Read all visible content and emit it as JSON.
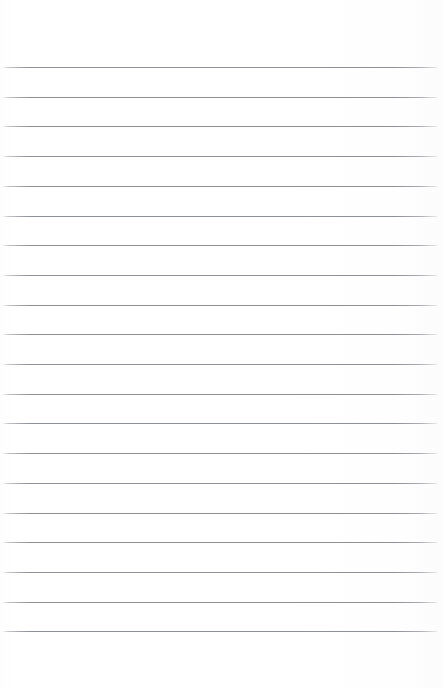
{
  "document": {
    "kind": "lined-paper",
    "title": "",
    "body_text": "",
    "page_number": "",
    "background_color": "#ffffff",
    "rule_color": "#8d9096",
    "sheet": {
      "width_px": 442,
      "height_px": 688
    },
    "ruling": {
      "line_count": 20,
      "first_line_y_px": 67,
      "line_spacing_px": 29.7,
      "line_thickness_px": 1,
      "line_left_x_px": 3,
      "line_right_x_px": 437,
      "top_margin_px": 67,
      "bottom_margin_px": 45,
      "left_margin_px": 3,
      "right_margin_px": 5,
      "margin_rule_visible": false,
      "line_positions_y_px": [
        67,
        96.7,
        126.4,
        156.1,
        185.8,
        215.5,
        245.2,
        274.9,
        304.6,
        334.3,
        364,
        393.7,
        423.4,
        453.1,
        482.8,
        512.5,
        542.2,
        571.9,
        601.6,
        631.3
      ]
    }
  }
}
